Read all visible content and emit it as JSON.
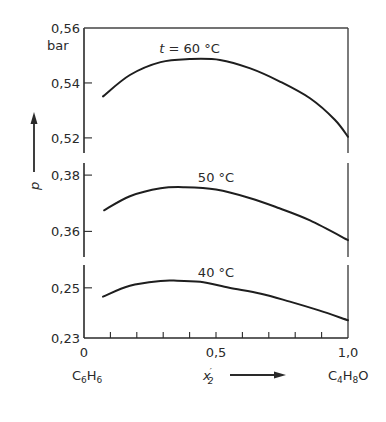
{
  "chart_data": {
    "type": "line",
    "title": "",
    "xlabel": "x'2",
    "xlabel_main": "x",
    "xlabel_prime": "′",
    "xlabel_sub": "2",
    "ylabel": "p",
    "yunit": "bar",
    "x_endpoint_labels": {
      "left": {
        "base1": "C",
        "sub1": "6",
        "base2": "H",
        "sub2": "6"
      },
      "right": {
        "base1": "C",
        "sub1": "4",
        "base2": "H",
        "sub2": "8",
        "base3": "O"
      }
    },
    "xlim": [
      0,
      1.0
    ],
    "x_ticks": [
      0,
      0.1,
      0.2,
      0.3,
      0.4,
      0.5,
      0.6,
      0.7,
      0.8,
      0.9,
      1.0
    ],
    "x_tick_labels": [
      {
        "value": 0,
        "label": "0"
      },
      {
        "value": 0.5,
        "label": "0,5"
      },
      {
        "value": 1.0,
        "label": "1,0"
      }
    ],
    "grid": false,
    "legend": "none (inline curve labels)",
    "panels": [
      {
        "name": "60C",
        "ylim": [
          0.5145,
          0.56
        ],
        "y_ticks": [
          {
            "value": 0.56,
            "label": "0,56"
          },
          {
            "value": 0.54,
            "label": "0,54"
          },
          {
            "value": 0.52,
            "label": "0,52"
          }
        ],
        "series": {
          "name": "t = 60 °C",
          "label": "t = 60 °C",
          "label_prefix": "t",
          "label_rest": " = 60 °C",
          "label_at": [
            0.4,
            0.551
          ],
          "x": [
            0.072,
            0.174,
            0.29,
            0.4,
            0.515,
            0.63,
            0.74,
            0.856,
            0.95,
            1.0
          ],
          "y": [
            0.5351,
            0.5429,
            0.5476,
            0.5487,
            0.5484,
            0.5453,
            0.5406,
            0.5344,
            0.5266,
            0.5204
          ]
        }
      },
      {
        "name": "50C",
        "ylim": [
          0.3509,
          0.3843
        ],
        "y_ticks": [
          {
            "value": 0.38,
            "label": "0,38"
          },
          {
            "value": 0.36,
            "label": "0,36"
          }
        ],
        "series": {
          "name": "50 °C",
          "label": "50 °C",
          "label_at": [
            0.5,
            0.3775
          ],
          "x": [
            0.076,
            0.174,
            0.29,
            0.38,
            0.5,
            0.63,
            0.74,
            0.856,
            1.0
          ],
          "y": [
            0.3675,
            0.3725,
            0.3753,
            0.3757,
            0.3749,
            0.3718,
            0.3682,
            0.3639,
            0.3569
          ]
        }
      },
      {
        "name": "40C",
        "ylim": [
          0.23,
          0.2591
        ],
        "y_ticks": [
          {
            "value": 0.25,
            "label": "0,25"
          },
          {
            "value": 0.23,
            "label": "0,23"
          }
        ],
        "series": {
          "name": "40 °C",
          "label": "40 °C",
          "label_at": [
            0.5,
            0.2545
          ],
          "x": [
            0.072,
            0.174,
            0.29,
            0.34,
            0.44,
            0.55,
            0.67,
            0.78,
            0.89,
            1.0
          ],
          "y": [
            0.2465,
            0.2508,
            0.2527,
            0.2529,
            0.2524,
            0.25,
            0.2476,
            0.2445,
            0.241,
            0.2371
          ]
        }
      }
    ]
  }
}
